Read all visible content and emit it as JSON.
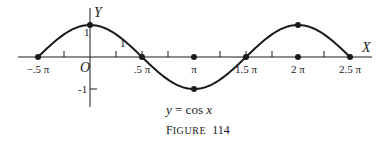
{
  "chart_data": {
    "type": "line",
    "title": "y = cos x",
    "caption": "FIGURE 114",
    "xlabel": "X",
    "ylabel": "Y",
    "origin_label": "O",
    "x_unit": "pi",
    "xlim": [
      -0.5,
      2.5
    ],
    "ylim": [
      -1,
      1
    ],
    "grid": false,
    "legend": null,
    "x_tick_labels": [
      {
        "x": -0.5,
        "label": "−.5 π"
      },
      {
        "x": 0.5,
        "label": ".5 π"
      },
      {
        "x": 1.0,
        "label": "π"
      },
      {
        "x": 1.5,
        "label": "1.5 π"
      },
      {
        "x": 2.0,
        "label": "2 π"
      },
      {
        "x": 2.5,
        "label": "2.5 π"
      }
    ],
    "minor_ticks_x": [
      -0.25,
      0.25,
      0.5,
      0.75,
      1.25,
      1.5,
      1.75,
      2.25
    ],
    "y_tick_labels": [
      {
        "y": 1,
        "label": "1"
      },
      {
        "y": -1,
        "label": "-1"
      }
    ],
    "series": [
      {
        "name": "y = cos x",
        "function": "cos",
        "x": [
          -0.5,
          0,
          0.5,
          1.0,
          1.5,
          2.0,
          2.5
        ],
        "values": [
          0,
          1,
          0,
          -1,
          0,
          1,
          0
        ]
      }
    ],
    "marked_points": [
      {
        "x": -0.5,
        "y": 0
      },
      {
        "x": 0,
        "y": 1
      },
      {
        "x": 0.5,
        "y": 0
      },
      {
        "x": 1.0,
        "y": 0
      },
      {
        "x": 1.0,
        "y": -1
      },
      {
        "x": 1.5,
        "y": 0
      },
      {
        "x": 2.0,
        "y": 1
      },
      {
        "x": 2.0,
        "y": 0
      },
      {
        "x": 2.5,
        "y": 0
      }
    ]
  },
  "labels": {
    "x_axis": "X",
    "y_axis": "Y",
    "origin": "O",
    "y_one": "1",
    "y_minus_one": "-1",
    "one_marker": "1",
    "caption_eq_y": "y",
    "caption_eq_eq": " = cos ",
    "caption_eq_x": "x",
    "caption_fig_F": "F",
    "caption_fig_rest": "IGURE",
    "caption_fig_num": "114"
  },
  "colors": {
    "ink": "#1a1a1a",
    "background": "#ffffff"
  }
}
